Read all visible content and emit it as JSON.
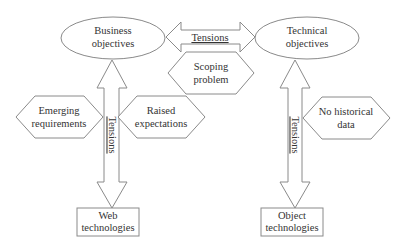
{
  "diagram": {
    "nodes": {
      "business_objectives": {
        "line1": "Business",
        "line2": "objectives",
        "shape": "ellipse"
      },
      "technical_objectives": {
        "line1": "Technical",
        "line2": "objectives",
        "shape": "ellipse"
      },
      "scoping_problem": {
        "line1": "Scoping",
        "line2": "problem",
        "shape": "hexagon"
      },
      "emerging_requirements": {
        "line1": "Emerging",
        "line2": "requirements",
        "shape": "hexagon"
      },
      "raised_expectations": {
        "line1": "Raised",
        "line2": "expectations",
        "shape": "hexagon"
      },
      "no_historical_data": {
        "line1": "No historical",
        "line2": "data",
        "shape": "hexagon"
      },
      "web_technologies": {
        "line1": "Web",
        "line2": "technologies",
        "shape": "rectangle"
      },
      "object_technologies": {
        "line1": "Object",
        "line2": "technologies",
        "shape": "rectangle"
      }
    },
    "edges": {
      "business_technical": {
        "label": "Tensions",
        "from": "Business objectives",
        "to": "Technical objectives",
        "type": "double-arrow"
      },
      "business_web": {
        "label": "Tensions",
        "from": "Business objectives",
        "to": "Web technologies",
        "type": "double-arrow"
      },
      "technical_object": {
        "label": "Tensions",
        "from": "Technical objectives",
        "to": "Object technologies",
        "type": "double-arrow"
      }
    },
    "colors": {
      "stroke": "#8a8a8a",
      "text": "#333333",
      "background": "#ffffff"
    }
  }
}
